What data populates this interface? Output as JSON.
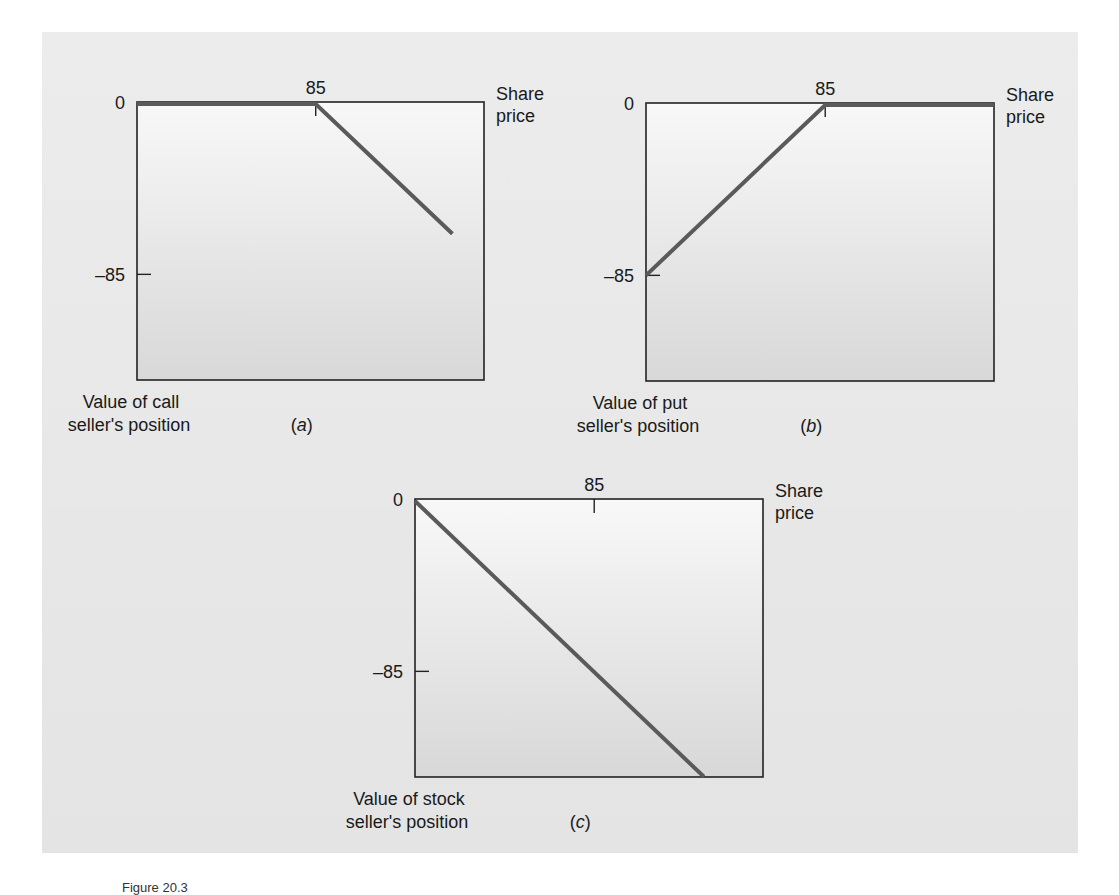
{
  "figure": {
    "caption": "Figure 20.3",
    "colors": {
      "background": "#e8e8e8",
      "plot_fill_top": "#f7f7f7",
      "plot_fill_bottom": "#d9d9d9",
      "frame": "#222222",
      "payoff_line": "#5a5a5a"
    }
  },
  "chart_data": [
    {
      "type": "line",
      "panel": "a",
      "panel_label": "(a)",
      "title": "",
      "xlabel": "Share price",
      "ylabel": "Value of call seller's position",
      "ylabel_lines": [
        "Value of call",
        "seller's position"
      ],
      "x_ticks": [
        {
          "value": 85,
          "label": "85"
        }
      ],
      "y_ticks": [
        {
          "value": 0,
          "label": "0"
        },
        {
          "value": -85,
          "label": "–85"
        }
      ],
      "xlim": [
        0,
        165
      ],
      "ylim": [
        -135,
        0
      ],
      "grid": false,
      "series": [
        {
          "name": "call seller payoff",
          "x": [
            0,
            85,
            150
          ],
          "y": [
            0,
            0,
            -65
          ]
        }
      ],
      "box": {
        "left": 137,
        "top": 102,
        "right": 484,
        "bottom": 380
      }
    },
    {
      "type": "line",
      "panel": "b",
      "panel_label": "(b)",
      "title": "",
      "xlabel": "Share price",
      "ylabel": "Value of put seller's position",
      "ylabel_lines": [
        "Value of put",
        "seller's position"
      ],
      "x_ticks": [
        {
          "value": 85,
          "label": "85"
        }
      ],
      "y_ticks": [
        {
          "value": 0,
          "label": "0"
        },
        {
          "value": -85,
          "label": "–85"
        }
      ],
      "xlim": [
        0,
        165
      ],
      "ylim": [
        -135,
        0
      ],
      "grid": false,
      "series": [
        {
          "name": "put seller payoff",
          "x": [
            0,
            85,
            165
          ],
          "y": [
            -85,
            0,
            0
          ]
        }
      ],
      "box": {
        "left": 646,
        "top": 103,
        "right": 994,
        "bottom": 381
      }
    },
    {
      "type": "line",
      "panel": "c",
      "panel_label": "(c)",
      "title": "",
      "xlabel": "Share price",
      "ylabel": "Value of stock seller's position",
      "ylabel_lines": [
        "Value of stock",
        "seller's position"
      ],
      "x_ticks": [
        {
          "value": 85,
          "label": "85"
        }
      ],
      "y_ticks": [
        {
          "value": 0,
          "label": "0"
        },
        {
          "value": -85,
          "label": "–85"
        }
      ],
      "xlim": [
        0,
        165
      ],
      "ylim": [
        -135,
        0
      ],
      "grid": false,
      "series": [
        {
          "name": "stock seller payoff",
          "x": [
            0,
            137
          ],
          "y": [
            0,
            -137
          ]
        }
      ],
      "box": {
        "left": 415,
        "top": 499,
        "right": 763,
        "bottom": 777
      }
    }
  ]
}
